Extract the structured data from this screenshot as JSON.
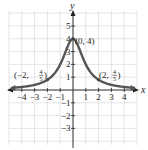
{
  "chart_data": {
    "type": "line",
    "title": "",
    "xlabel": "x",
    "ylabel": "y",
    "function": "y = 4/(x^2+1)",
    "xlim": [
      -4.8,
      4.8
    ],
    "ylim": [
      -4,
      6
    ],
    "grid": true,
    "x_ticks": [
      -4,
      -3,
      -2,
      -1,
      1,
      2,
      3,
      4
    ],
    "y_ticks": [
      -3,
      -2,
      -1,
      1,
      2,
      3,
      4,
      5
    ],
    "x_tick_labels": [
      "−4",
      "−3",
      "−2",
      "−1",
      "1",
      "2",
      "3",
      "4"
    ],
    "y_tick_labels": [
      "−3",
      "−2",
      "−1",
      "1",
      "2",
      "3",
      "4",
      "5"
    ],
    "series": [
      {
        "name": "curve",
        "x": [
          -4.8,
          -4,
          -3,
          -2,
          -1,
          0,
          1,
          2,
          3,
          4,
          4.8
        ],
        "y": [
          0.166,
          0.235,
          0.4,
          0.8,
          2,
          4,
          2,
          0.8,
          0.4,
          0.235,
          0.166
        ],
        "color": "#555555"
      }
    ],
    "annotations": [
      {
        "point": [
          0,
          4
        ],
        "text": "(0, 4)"
      },
      {
        "point": [
          -2,
          0.8
        ],
        "text": "(−2, 4/5)"
      },
      {
        "point": [
          2,
          0.8
        ],
        "text": "(2, 4/5)"
      }
    ]
  },
  "labels": {
    "x_axis": "x",
    "y_axis": "y",
    "peak": "(0, 4)",
    "left_prefix": "(−2, ",
    "right_prefix": "(2, ",
    "frac_num": "4",
    "frac_den": "5",
    "close": ")"
  }
}
